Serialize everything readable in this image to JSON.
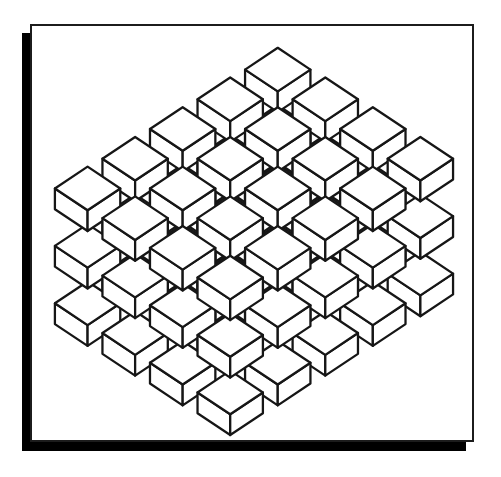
{
  "scene": {
    "canvas": {
      "width": 501,
      "height": 477,
      "background": "#ffffff"
    },
    "shadow": {
      "offset_x": -8,
      "offset_y": 9,
      "color": "#000000"
    },
    "card": {
      "x": 30,
      "y": 24,
      "width": 444,
      "height": 418,
      "fill": "#ffffff",
      "border_color": "#1c1c1c",
      "border_width": 2
    }
  },
  "illustration": {
    "type": "isometric-cube-lattice",
    "grid": {
      "rows_down_right": 4,
      "rows_down_left": 5,
      "layers": 3,
      "cube_count": 60
    },
    "projection": {
      "apex_x": 248,
      "apex_y": 22,
      "step_right_dx": 48,
      "step_right_dy": 30,
      "step_left_dx": -48,
      "step_left_dy": 30,
      "layer_gap_dy": 58,
      "half_width": 33,
      "half_height": 22,
      "side_height": 21
    },
    "style": {
      "cube_fill": "#ffffff",
      "line_color": "#161616",
      "line_width": 2.3
    }
  }
}
